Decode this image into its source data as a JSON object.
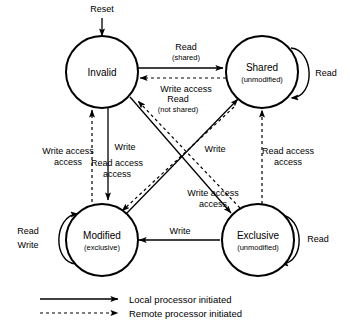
{
  "diagram": {
    "colors": {
      "stroke": "#000000",
      "background": "#ffffff"
    },
    "entry": {
      "label": "Reset"
    },
    "states": [
      {
        "id": "invalid",
        "name": "Invalid",
        "sub": ""
      },
      {
        "id": "shared",
        "name": "Shared",
        "sub": "(unmodified)"
      },
      {
        "id": "modified",
        "name": "Modified",
        "sub": "(exclusive)"
      },
      {
        "id": "exclusive",
        "name": "Exclusive",
        "sub": "(unmodified)"
      }
    ],
    "self_loops": [
      {
        "id": "shared-read",
        "state": "shared",
        "label": "Read",
        "label2": "",
        "kind": "local"
      },
      {
        "id": "exclusive-read",
        "state": "exclusive",
        "label": "Read",
        "label2": "",
        "kind": "local"
      },
      {
        "id": "modified-rw",
        "state": "modified",
        "label": "Read",
        "label2": "Write",
        "kind": "local"
      }
    ],
    "transitions": [
      {
        "id": "invalid-to-shared",
        "from": "Invalid",
        "to": "Shared",
        "label": "Read",
        "sub": "(shared)",
        "kind": "local"
      },
      {
        "id": "shared-to-invalid",
        "from": "Shared",
        "to": "Invalid",
        "label": "Write access",
        "sub": "",
        "kind": "remote"
      },
      {
        "id": "invalid-to-exclusive",
        "from": "Invalid",
        "to": "Exclusive",
        "label": "Read",
        "sub": "(not shared)",
        "kind": "local"
      },
      {
        "id": "exclusive-to-invalid",
        "from": "Exclusive",
        "to": "Invalid",
        "label": "Write access",
        "sub": "",
        "kind": "remote"
      },
      {
        "id": "invalid-to-modified",
        "from": "Invalid",
        "to": "Modified",
        "label": "Write",
        "sub": "",
        "kind": "local"
      },
      {
        "id": "modified-to-invalid",
        "from": "Modified",
        "to": "Invalid",
        "label": "Write access",
        "sub": "",
        "kind": "remote"
      },
      {
        "id": "modified-to-shared",
        "from": "Modified",
        "to": "Shared",
        "label": "Write",
        "sub": "",
        "kind": "local"
      },
      {
        "id": "shared-to-modified",
        "from": "Shared",
        "to": "Modified",
        "label": "Read access",
        "sub": "",
        "kind": "remote"
      },
      {
        "id": "exclusive-to-modified",
        "from": "Exclusive",
        "to": "Modified",
        "label": "Write",
        "sub": "",
        "kind": "local"
      },
      {
        "id": "exclusive-to-shared",
        "from": "Exclusive",
        "to": "Shared",
        "label": "Read access",
        "sub": "",
        "kind": "remote"
      }
    ],
    "legend": [
      {
        "id": "local",
        "style": "solid",
        "label": "Local processor initiated"
      },
      {
        "id": "remote",
        "style": "dashed",
        "label": "Remote processor initiated"
      }
    ]
  }
}
